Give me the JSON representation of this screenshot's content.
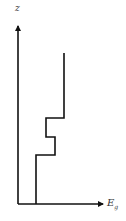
{
  "diagram": {
    "type": "step-profile",
    "y_axis": {
      "label": "z"
    },
    "x_axis": {
      "label": "E",
      "label_subscript": "g"
    },
    "colors": {
      "line": "#111111",
      "background": "#ffffff"
    },
    "profile_points_px": [
      [
        36,
        204
      ],
      [
        36,
        155
      ],
      [
        55,
        155
      ],
      [
        55,
        137
      ],
      [
        46,
        137
      ],
      [
        46,
        118
      ],
      [
        64,
        118
      ],
      [
        64,
        53
      ]
    ]
  }
}
